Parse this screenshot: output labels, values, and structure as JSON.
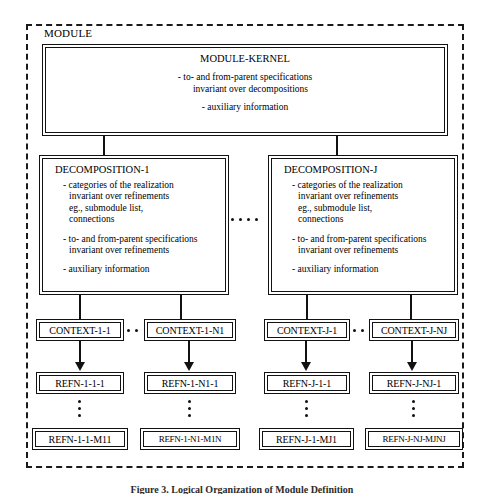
{
  "figure": {
    "outer_frame_label": "MODULE",
    "caption": "Figure 3. Logical Organization of Module Definition",
    "line_color": "#111111",
    "background": "#ffffff"
  },
  "kernel": {
    "title": "MODULE-KERNEL",
    "lines": [
      "- to- and from-parent specifications",
      "invariant over decompositions",
      "- auxiliary information"
    ]
  },
  "decompositions": [
    {
      "title": "DECOMPOSITION-1",
      "lines": [
        "- categories of the realization",
        "invariant over refinements",
        "eg., submodule list,",
        "connections",
        "- to- and from-parent specifications",
        "invariant over refinements",
        "- auxiliary information"
      ]
    },
    {
      "title": "DECOMPOSITION-J",
      "lines": [
        "- categories of the realization",
        "invariant over refinements",
        "eg., submodule list,",
        "connections",
        "- to- and from-parent specifications",
        "invariant over refinements",
        "- auxiliary information"
      ]
    }
  ],
  "contexts": [
    {
      "label": "CONTEXT-1-1"
    },
    {
      "label": "CONTEXT-1-N1"
    },
    {
      "label": "CONTEXT-J-1"
    },
    {
      "label": "CONTEXT-J-NJ"
    }
  ],
  "refinements_top": [
    {
      "label": "REFN-1-1-1"
    },
    {
      "label": "REFN-1-N1-1"
    },
    {
      "label": "REFN-J-1-1"
    },
    {
      "label": "REFN-J-NJ-1"
    }
  ],
  "refinements_bottom": [
    {
      "label": "REFN-1-1-M11"
    },
    {
      "label": "REFN-1-N1-M1N"
    },
    {
      "label": "REFN-J-1-MJ1"
    },
    {
      "label": "REFN-J-NJ-MJNJ"
    }
  ],
  "ellipses": {
    "decomposition_dots": 4,
    "context_dots": 2,
    "refinement_dots": 3
  }
}
